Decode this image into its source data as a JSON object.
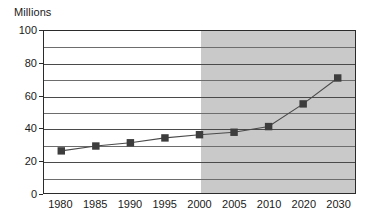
{
  "chart_data": {
    "type": "line",
    "title": "",
    "ylabel": "Millions",
    "xlabel": "",
    "ylim": [
      0,
      100
    ],
    "ytick_step": 20,
    "gridline_step": 10,
    "grid": true,
    "legend": "none",
    "marker": "square",
    "categories": [
      "1980",
      "1985",
      "1990",
      "1995",
      "2000",
      "2005",
      "2010",
      "2020",
      "2030"
    ],
    "values": [
      26,
      29,
      31,
      34,
      36,
      37.5,
      41,
      55,
      71
    ],
    "ytick_labels": [
      "0",
      "20",
      "40",
      "60",
      "80",
      "100"
    ],
    "ytick_values": [
      0,
      20,
      40,
      60,
      80,
      100
    ],
    "gridline_values": [
      10,
      20,
      30,
      40,
      50,
      60,
      70,
      80,
      90,
      100
    ],
    "annotations": [
      {
        "name": "forecast-shading",
        "label": "",
        "from_category": "2000",
        "to_category": "2030",
        "color": "#c9c9c9"
      }
    ],
    "colors": {
      "plot_background": "#ffffff",
      "forecast_background": "#c9c9c9",
      "axis": "#2b2b2b",
      "gridline": "#6d6d6d",
      "line": "#4a4a4a",
      "marker": "#3d3d3d",
      "text": "#1a1a1a"
    }
  }
}
